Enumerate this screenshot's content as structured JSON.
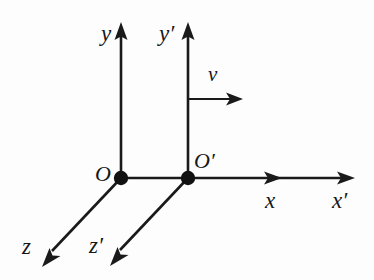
{
  "figure": {
    "type": "physics-coordinate-diagram",
    "background_color": "#fdfdfd",
    "ink_color": "#1a1a1a",
    "canvas": {
      "width": 374,
      "height": 280
    }
  },
  "labels": {
    "y_axis": "y",
    "y_prime_axis": "y′",
    "x_axis": "x",
    "x_prime_axis": "x′",
    "z_axis": "z",
    "z_prime_axis": "z′",
    "origin": "O",
    "origin_prime": "O′",
    "velocity": "v"
  },
  "frames": [
    {
      "name": "unprimed-frame",
      "origin_label": "O",
      "origin_point": {
        "x": 121,
        "y": 178
      },
      "axes": [
        {
          "name": "y",
          "label": "y",
          "direction": "up",
          "tip": {
            "x": 121,
            "y": 24
          }
        },
        {
          "name": "x",
          "label": "x",
          "direction": "right",
          "tip": {
            "x": 282,
            "y": 178
          }
        },
        {
          "name": "z",
          "label": "z",
          "direction": "down-left",
          "tip": {
            "x": 44,
            "y": 266
          }
        }
      ]
    },
    {
      "name": "primed-frame",
      "origin_label": "O′",
      "origin_point": {
        "x": 188,
        "y": 178
      },
      "axes": [
        {
          "name": "y-prime",
          "label": "y′",
          "direction": "up",
          "tip": {
            "x": 188,
            "y": 24
          }
        },
        {
          "name": "x-prime",
          "label": "x′",
          "direction": "right",
          "tip": {
            "x": 355,
            "y": 178
          }
        },
        {
          "name": "z-prime",
          "label": "z′",
          "direction": "down-left",
          "tip": {
            "x": 112,
            "y": 265
          }
        }
      ]
    }
  ],
  "velocity_vector": {
    "label": "v",
    "from": {
      "x": 188,
      "y": 99
    },
    "to": {
      "x": 241,
      "y": 99
    },
    "direction": "right"
  }
}
